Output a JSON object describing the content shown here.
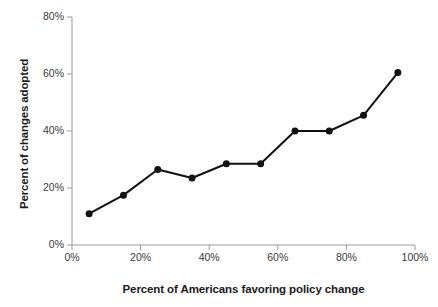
{
  "chart_data": {
    "type": "line",
    "title": "",
    "xlabel": "Percent of Americans favoring policy change",
    "ylabel": "Percent of changes adopted",
    "x": [
      5,
      15,
      25,
      35,
      45,
      55,
      65,
      75,
      85,
      95
    ],
    "values": [
      11,
      17.5,
      26.5,
      23.5,
      28.5,
      28.5,
      40,
      40,
      45.5,
      60.5
    ],
    "xlim": [
      0,
      100
    ],
    "ylim": [
      0,
      80
    ],
    "xticks": [
      0,
      20,
      40,
      60,
      80,
      100
    ],
    "yticks": [
      0,
      20,
      40,
      60,
      80
    ],
    "xtick_labels": [
      "0%",
      "20%",
      "40%",
      "60%",
      "80%",
      "100%"
    ],
    "ytick_labels": [
      "0%",
      "20%",
      "40%",
      "60%",
      "80%"
    ],
    "grid": false,
    "legend": null,
    "series_color": "#111111",
    "axis_color": "#9a9a9a",
    "marker": "circle",
    "marker_size": 7,
    "line_width": 2
  }
}
